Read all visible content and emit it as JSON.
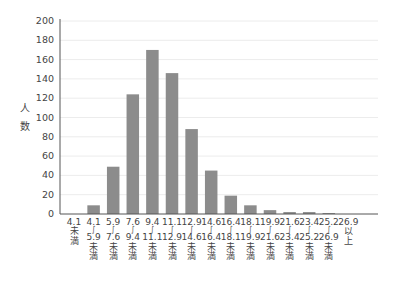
{
  "chart_data": {
    "type": "bar",
    "title": "",
    "xlabel": "",
    "ylabel": "人数",
    "ylabel_chars": [
      "人",
      "数"
    ],
    "ylim": [
      0,
      200
    ],
    "yticks": [
      0,
      20,
      40,
      60,
      80,
      100,
      120,
      140,
      160,
      180,
      200
    ],
    "grid": true,
    "legend": null,
    "bar_color": "#8c8c8c",
    "grid_color": "#ececec",
    "axis_color": "#555555",
    "categories": [
      {
        "lines": [
          "4.1",
          "未",
          "満"
        ]
      },
      {
        "lines": [
          "4.1",
          "～",
          "5.9",
          "未",
          "満"
        ]
      },
      {
        "lines": [
          "5.9",
          "～",
          "7.6",
          "未",
          "満"
        ]
      },
      {
        "lines": [
          "7.6",
          "～",
          "9.4",
          "未",
          "満"
        ]
      },
      {
        "lines": [
          "9.4",
          "～",
          "11.1",
          "未",
          "満"
        ]
      },
      {
        "lines": [
          "11.1",
          "～",
          "12.9",
          "未",
          "満"
        ]
      },
      {
        "lines": [
          "12.9",
          "～",
          "14.6",
          "未",
          "満"
        ]
      },
      {
        "lines": [
          "14.6",
          "～",
          "16.4",
          "未",
          "満"
        ]
      },
      {
        "lines": [
          "16.4",
          "～",
          "18.1",
          "未",
          "満"
        ]
      },
      {
        "lines": [
          "18.1",
          "～",
          "19.9",
          "未",
          "満"
        ]
      },
      {
        "lines": [
          "19.9",
          "～",
          "21.6",
          "未",
          "満"
        ]
      },
      {
        "lines": [
          "21.6",
          "～",
          "23.4",
          "未",
          "満"
        ]
      },
      {
        "lines": [
          "23.4",
          "～",
          "25.2",
          "未",
          "満"
        ]
      },
      {
        "lines": [
          "25.2",
          "～",
          "26.9",
          "未",
          "満"
        ]
      },
      {
        "lines": [
          "26.9",
          "以",
          "上"
        ]
      }
    ],
    "category_labels": [
      "4.1未満",
      "4.1～5.9未満",
      "5.9～7.6未満",
      "7.6～9.4未満",
      "9.4～11.1未満",
      "11.1～12.9未満",
      "12.9～14.6未満",
      "14.6～16.4未満",
      "16.4～18.1未満",
      "18.1～19.9未満",
      "19.9～21.6未満",
      "21.6～23.4未満",
      "23.4～25.2未満",
      "25.2～26.9未満",
      "26.9以上"
    ],
    "values": [
      0,
      9,
      49,
      124,
      170,
      146,
      88,
      45,
      19,
      9,
      4,
      2,
      2,
      1,
      0
    ]
  }
}
